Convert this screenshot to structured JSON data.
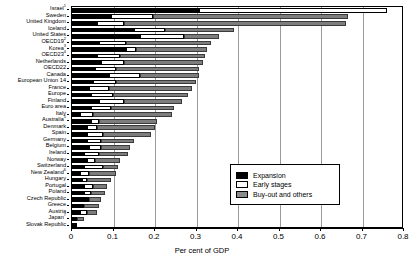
{
  "chart_data": {
    "type": "bar",
    "orientation": "horizontal",
    "stacked": true,
    "title": "",
    "xlabel": "Per cent of GDP",
    "ylabel": "",
    "xlim": [
      0,
      0.8
    ],
    "xticks": [
      "0",
      "0.1",
      "0.2",
      "0.3",
      "0.4",
      "0.5",
      "0.6",
      "0.7",
      "0.8"
    ],
    "xtick_values": [
      0,
      0.1,
      0.2,
      0.3,
      0.4,
      0.5,
      0.6,
      0.7,
      0.8
    ],
    "grid": true,
    "legend_position": "inside-right",
    "series": [
      {
        "name": "Expansion",
        "color": "#000000"
      },
      {
        "name": "Early stages",
        "color": "#ffffff"
      },
      {
        "name": "Buy-out and others",
        "color": "#7d7d7d"
      }
    ],
    "categories": [
      "Israel",
      "Sweden",
      "United Kingdom",
      "Iceland",
      "United States",
      "OECD19",
      "Korea",
      "OECD23",
      "Netherlands",
      "OECD22",
      "Canada",
      "European Union 14",
      "France",
      "Europe",
      "Finland",
      "Euro area",
      "Italy",
      "Australia",
      "Denmark",
      "Spain",
      "Germany",
      "Belgium",
      "Ireland",
      "Norway",
      "Switzerland",
      "New Zealand",
      "Hungary",
      "Portugal",
      "Poland",
      "Czech Republic",
      "Greece",
      "Austria",
      "Japan",
      "Slovak Republic"
    ],
    "footnotes": {
      "Israel": "1",
      "OECD19": "2",
      "Korea": "3",
      "OECD23": "4",
      "Australia": "5",
      "New Zealand": "6",
      "Japan": "7"
    },
    "rows": [
      {
        "category": "Israel",
        "footnote": "1",
        "expansion": 0.305,
        "early": 0.455,
        "buyout": 0.0,
        "total": 0.76
      },
      {
        "category": "Sweden",
        "footnote": "",
        "expansion": 0.095,
        "early": 0.1,
        "buyout": 0.47,
        "total": 0.665
      },
      {
        "category": "United Kingdom",
        "footnote": "",
        "expansion": 0.06,
        "early": 0.065,
        "buyout": 0.535,
        "total": 0.66
      },
      {
        "category": "Iceland",
        "footnote": "",
        "expansion": 0.15,
        "early": 0.075,
        "buyout": 0.165,
        "total": 0.39
      },
      {
        "category": "United States",
        "footnote": "",
        "expansion": 0.165,
        "early": 0.105,
        "buyout": 0.085,
        "total": 0.355
      },
      {
        "category": "OECD19",
        "footnote": "2",
        "expansion": 0.065,
        "early": 0.065,
        "buyout": 0.205,
        "total": 0.335
      },
      {
        "category": "Korea",
        "footnote": "3",
        "expansion": 0.13,
        "early": 0.025,
        "buyout": 0.17,
        "total": 0.325
      },
      {
        "category": "OECD23",
        "footnote": "4",
        "expansion": 0.06,
        "early": 0.055,
        "buyout": 0.205,
        "total": 0.32
      },
      {
        "category": "Netherlands",
        "footnote": "",
        "expansion": 0.07,
        "early": 0.055,
        "buyout": 0.19,
        "total": 0.315
      },
      {
        "category": "OECD22",
        "footnote": "",
        "expansion": 0.055,
        "early": 0.05,
        "buyout": 0.2,
        "total": 0.305
      },
      {
        "category": "Canada",
        "footnote": "",
        "expansion": 0.09,
        "early": 0.075,
        "buyout": 0.14,
        "total": 0.305
      },
      {
        "category": "European Union 14",
        "footnote": "",
        "expansion": 0.05,
        "early": 0.055,
        "buyout": 0.195,
        "total": 0.3
      },
      {
        "category": "France",
        "footnote": "",
        "expansion": 0.04,
        "early": 0.05,
        "buyout": 0.2,
        "total": 0.29
      },
      {
        "category": "Europe",
        "footnote": "",
        "expansion": 0.045,
        "early": 0.055,
        "buyout": 0.18,
        "total": 0.28
      },
      {
        "category": "Finland",
        "footnote": "",
        "expansion": 0.065,
        "early": 0.06,
        "buyout": 0.14,
        "total": 0.265
      },
      {
        "category": "Euro area",
        "footnote": "",
        "expansion": 0.045,
        "early": 0.05,
        "buyout": 0.15,
        "total": 0.245
      },
      {
        "category": "Italy",
        "footnote": "",
        "expansion": 0.02,
        "early": 0.03,
        "buyout": 0.19,
        "total": 0.24
      },
      {
        "category": "Australia",
        "footnote": "5",
        "expansion": 0.045,
        "early": 0.02,
        "buyout": 0.14,
        "total": 0.205
      },
      {
        "category": "Denmark",
        "footnote": "",
        "expansion": 0.035,
        "early": 0.025,
        "buyout": 0.14,
        "total": 0.2
      },
      {
        "category": "Spain",
        "footnote": "",
        "expansion": 0.035,
        "early": 0.04,
        "buyout": 0.115,
        "total": 0.19
      },
      {
        "category": "Germany",
        "footnote": "",
        "expansion": 0.035,
        "early": 0.035,
        "buyout": 0.08,
        "total": 0.15
      },
      {
        "category": "Belgium",
        "footnote": "",
        "expansion": 0.04,
        "early": 0.03,
        "buyout": 0.07,
        "total": 0.14
      },
      {
        "category": "Ireland",
        "footnote": "",
        "expansion": 0.03,
        "early": 0.035,
        "buyout": 0.07,
        "total": 0.135
      },
      {
        "category": "Norway",
        "footnote": "",
        "expansion": 0.035,
        "early": 0.02,
        "buyout": 0.06,
        "total": 0.115
      },
      {
        "category": "Switzerland",
        "footnote": "",
        "expansion": 0.03,
        "early": 0.045,
        "buyout": 0.035,
        "total": 0.11
      },
      {
        "category": "New Zealand",
        "footnote": "6",
        "expansion": 0.02,
        "early": 0.02,
        "buyout": 0.065,
        "total": 0.105
      },
      {
        "category": "Hungary",
        "footnote": "",
        "expansion": 0.025,
        "early": 0.01,
        "buyout": 0.06,
        "total": 0.095
      },
      {
        "category": "Portugal",
        "footnote": "",
        "expansion": 0.03,
        "early": 0.02,
        "buyout": 0.035,
        "total": 0.085
      },
      {
        "category": "Poland",
        "footnote": "",
        "expansion": 0.03,
        "early": 0.015,
        "buyout": 0.035,
        "total": 0.08
      },
      {
        "category": "Czech Republic",
        "footnote": "",
        "expansion": 0.035,
        "early": 0.005,
        "buyout": 0.03,
        "total": 0.07
      },
      {
        "category": "Greece",
        "footnote": "",
        "expansion": 0.025,
        "early": 0.005,
        "buyout": 0.035,
        "total": 0.065
      },
      {
        "category": "Austria",
        "footnote": "",
        "expansion": 0.02,
        "early": 0.015,
        "buyout": 0.025,
        "total": 0.06
      },
      {
        "category": "Japan",
        "footnote": "7",
        "expansion": 0.008,
        "early": 0.005,
        "buyout": 0.015,
        "total": 0.028
      },
      {
        "category": "Slovak Republic",
        "footnote": "",
        "expansion": 0.012,
        "early": 0.0,
        "buyout": 0.0,
        "total": 0.012
      }
    ]
  },
  "legend": {
    "items": [
      {
        "key": "expansion",
        "label": "Expansion"
      },
      {
        "key": "early",
        "label": "Early stages"
      },
      {
        "key": "buyout",
        "label": "Buy-out and others"
      }
    ]
  },
  "axis": {
    "title": "Per cent of GDP"
  }
}
